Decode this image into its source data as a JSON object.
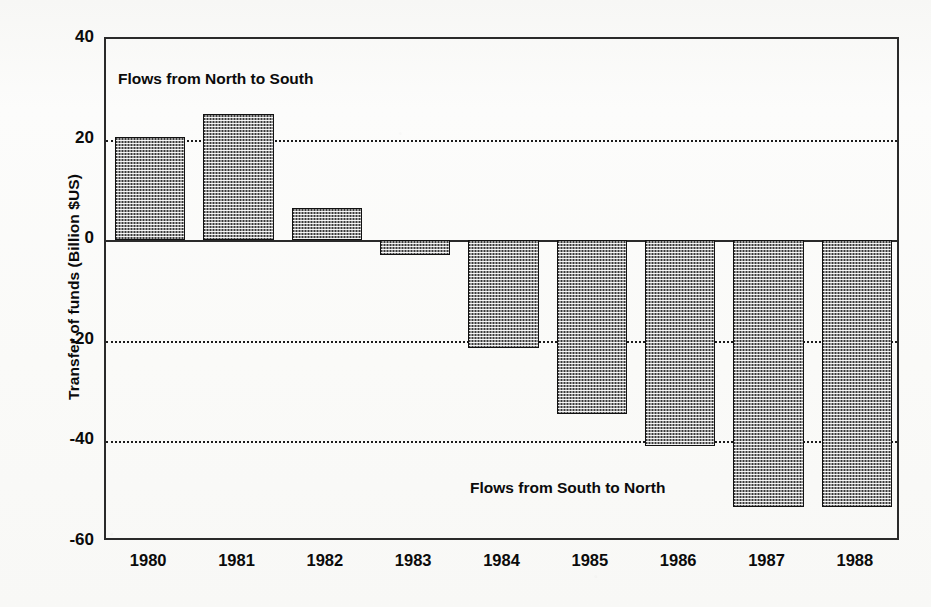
{
  "chart_data": {
    "type": "bar",
    "title": "",
    "xlabel": "",
    "ylabel": "Transfer of funds (Billion $US)",
    "categories": [
      "1980",
      "1981",
      "1982",
      "1983",
      "1984",
      "1985",
      "1986",
      "1987",
      "1988"
    ],
    "values": [
      20.5,
      25.0,
      6.5,
      -3.0,
      -21.5,
      -34.5,
      -41.0,
      -53.0,
      -53.0
    ],
    "ylim": [
      -60,
      40
    ],
    "yticks": [
      40,
      20,
      0,
      -20,
      -40,
      -60
    ],
    "ytick_labels": [
      "40",
      "20",
      "0",
      "-20",
      "-40",
      "-60"
    ],
    "grid": "horizontal-dotted at 20, -20, -40; solid axis at 0",
    "legend_position": "none",
    "annotations": [
      {
        "text": "Flows from North to South",
        "region": "upper-left"
      },
      {
        "text": "Flows from South to North",
        "region": "lower-right"
      }
    ],
    "bar_fill": "#3a3a3a",
    "bar_pattern": "fine checkerboard halftone",
    "bar_edge_color": "#111111",
    "axis_color": "#2a2a2a",
    "background_color": "#fbfbfa"
  },
  "axis": {
    "y_title": "Transfer of funds (Billion $US)"
  },
  "annotations": {
    "north_to_south": "Flows from North to South",
    "south_to_north": "Flows from South to North"
  }
}
